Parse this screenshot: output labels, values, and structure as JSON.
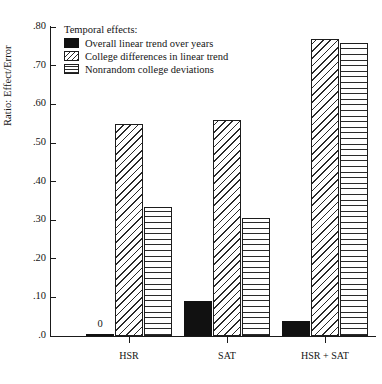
{
  "chart_data": {
    "type": "bar",
    "title": "",
    "xlabel": "",
    "ylabel": "Ratio: Effect/Error",
    "categories": [
      "HSR",
      "SAT",
      "HSR + SAT"
    ],
    "series": [
      {
        "name": "Overall linear trend over years",
        "pattern": "solid-black",
        "values": [
          0,
          0.09,
          0.038
        ]
      },
      {
        "name": "College differences in linear trend",
        "pattern": "diagonal-hatch",
        "values": [
          0.55,
          0.56,
          0.77
        ]
      },
      {
        "name": "Nonrandom college deviations",
        "pattern": "crosshatch-grid",
        "values": [
          0.335,
          0.305,
          0.76
        ]
      }
    ],
    "ylim": [
      0,
      0.8
    ],
    "yticks": [
      0,
      0.1,
      0.2,
      0.3,
      0.4,
      0.5,
      0.6,
      0.7,
      0.8
    ],
    "ytick_labels": [
      ".0",
      ".10",
      ".20",
      ".30",
      ".40",
      ".50",
      ".60",
      ".70",
      ".80"
    ],
    "grid": false,
    "legend_position": "top-left",
    "annotations": [
      {
        "text": "0",
        "category": "HSR",
        "series": "Overall linear trend over years"
      }
    ]
  },
  "legend": {
    "title": "Temporal effects:",
    "entries": [
      {
        "label": "Overall linear trend over years"
      },
      {
        "label": "College differences in linear trend"
      },
      {
        "label": "Nonrandom college deviations"
      }
    ]
  },
  "axes": {
    "y_title": "Ratio: Effect/Error",
    "y_labels": [
      ".80",
      ".70",
      ".60",
      ".50",
      ".40",
      ".30",
      ".20",
      ".10",
      ".0"
    ],
    "x_labels": [
      "HSR",
      "SAT",
      "HSR + SAT"
    ]
  }
}
